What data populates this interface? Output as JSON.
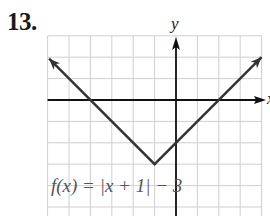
{
  "problem": {
    "number": "13."
  },
  "chart_data": {
    "type": "line",
    "title": "",
    "function_label": "f(x) = |x + 1| − 3",
    "xlabel": "x",
    "ylabel": "y",
    "grid": true,
    "grid_step": 1,
    "tick_labels": false,
    "xlim": [
      -6,
      4
    ],
    "ylim": [
      -5.4,
      3
    ],
    "vertex": [
      -1,
      -3
    ],
    "series": [
      {
        "name": "f(x) = |x + 1| − 3",
        "x": [
          -5.93,
          -1,
          4
        ],
        "y": [
          1.93,
          -3,
          2
        ],
        "arrows_at_ends": true
      }
    ],
    "x_intercepts": [
      -4,
      2
    ],
    "y_intercept": -2
  },
  "layout": {
    "origin_px": [
      176,
      100
    ],
    "unit_px": 21.4,
    "colors": {
      "grid": "#cfcfcf",
      "axis": "#111111",
      "curve": "#333333",
      "label": "#555555"
    }
  }
}
